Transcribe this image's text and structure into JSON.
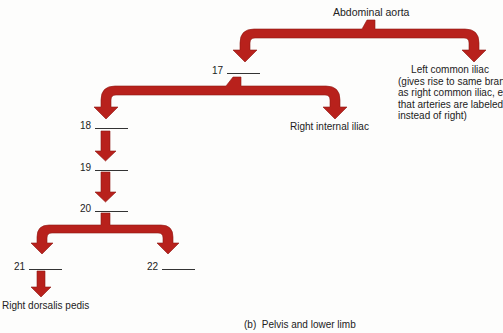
{
  "diagram": {
    "title": "Abdominal aorta",
    "arrow_color": "#b8211c",
    "nodes": {
      "left_common_iliac": {
        "label": "Left common iliac",
        "note_lines": [
          "(gives rise to same branches",
          "as right common iliac, except",
          "that arteries are labeled left",
          "instead of right)"
        ]
      },
      "n17": {
        "number": "17"
      },
      "right_internal_iliac": {
        "label": "Right internal iliac"
      },
      "n18": {
        "number": "18"
      },
      "n19": {
        "number": "19"
      },
      "n20": {
        "number": "20"
      },
      "n21": {
        "number": "21"
      },
      "n22": {
        "number": "22"
      },
      "right_dorsalis_pedis": {
        "label": "Right dorsalis pedis"
      }
    },
    "caption": "(b)  Pelvis and lower limb"
  }
}
